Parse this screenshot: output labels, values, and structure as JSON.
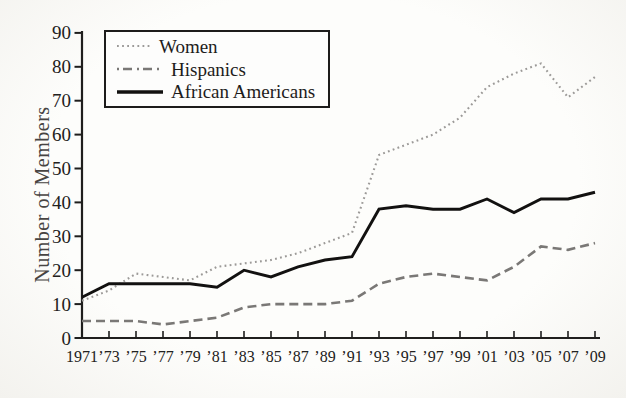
{
  "figure": {
    "background": "#fdfdfb",
    "axis_color": "#1f1e1d",
    "label_color": "#474442"
  },
  "chart_data": {
    "type": "line",
    "title": "",
    "xlabel": "",
    "ylabel": "Number of Members",
    "ylim": [
      0,
      90
    ],
    "ytick_step": 10,
    "y_tick_labels": [
      "0",
      "10",
      "20",
      "30",
      "40",
      "50",
      "60",
      "70",
      "80",
      "90"
    ],
    "x": [
      1971,
      1973,
      1975,
      1977,
      1979,
      1981,
      1983,
      1985,
      1987,
      1989,
      1991,
      1993,
      1995,
      1997,
      1999,
      2001,
      2003,
      2005,
      2007,
      2009
    ],
    "x_tick_labels": [
      "1971",
      "’73",
      "’75",
      "’77",
      "’79",
      "’81",
      "’83",
      "’85",
      "’87",
      "’89",
      "’91",
      "’93",
      "’95",
      "’97",
      "’99",
      "’01",
      "’03",
      "’05",
      "’07",
      "’09"
    ],
    "grid": false,
    "legend_position": "top-left",
    "series": [
      {
        "name": "Women",
        "style": "dotted",
        "color": "#9c9a98",
        "values": [
          11,
          14,
          19,
          18,
          17,
          21,
          22,
          23,
          25,
          28,
          31,
          54,
          57,
          60,
          65,
          74,
          78,
          81,
          71,
          77
        ]
      },
      {
        "name": "Hispanics",
        "style": "dashed",
        "color": "#7a7876",
        "values": [
          5,
          5,
          5,
          4,
          5,
          6,
          9,
          10,
          10,
          10,
          11,
          16,
          18,
          19,
          18,
          17,
          21,
          27,
          26,
          28
        ]
      },
      {
        "name": "African Americans",
        "style": "solid",
        "color": "#121110",
        "values": [
          12,
          16,
          16,
          16,
          16,
          15,
          20,
          18,
          21,
          23,
          24,
          38,
          39,
          38,
          38,
          41,
          37,
          41,
          41,
          43
        ]
      }
    ]
  }
}
